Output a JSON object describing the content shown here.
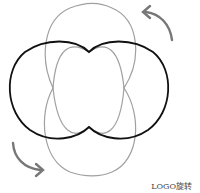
{
  "caption": "LOGO旋转",
  "colors": {
    "gray_shape": "#9a9a9a",
    "black_shape": "#111111",
    "arrows": "#777777"
  },
  "icons": [
    "rotate-arrow-top-right",
    "rotate-arrow-bottom-left"
  ]
}
